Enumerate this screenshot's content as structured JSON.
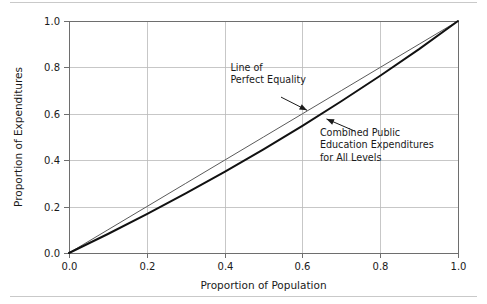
{
  "figure": {
    "background_color": "#ffffff",
    "rule_color": "#c9c9c9",
    "has_top_rule": true,
    "has_bottom_rule": true
  },
  "chart_data": {
    "type": "line",
    "title": "",
    "subtitle": "",
    "xlabel": "Proportion of Population",
    "ylabel": "Proportion of Expenditures",
    "xlim": [
      0.0,
      1.0
    ],
    "ylim": [
      0.0,
      1.0
    ],
    "xticks": [
      "0.0",
      "0.2",
      "0.4",
      "0.6",
      "0.8",
      "1.0"
    ],
    "yticks": [
      "0.0",
      "0.2",
      "0.4",
      "0.6",
      "0.8",
      "1.0"
    ],
    "xtick_values": [
      0.0,
      0.2,
      0.4,
      0.6,
      0.8,
      1.0
    ],
    "ytick_values": [
      0.0,
      0.2,
      0.4,
      0.6,
      0.8,
      1.0
    ],
    "grid": true,
    "grid_color": "#b9b9b9",
    "legend_position": "none",
    "x": [
      0.0,
      0.1,
      0.2,
      0.3,
      0.4,
      0.5,
      0.6,
      0.7,
      0.8,
      0.9,
      1.0
    ],
    "series": [
      {
        "name": "Line of Perfect Equality",
        "color": "#5a5a5a",
        "line_width": 1,
        "values": [
          0.0,
          0.1,
          0.2,
          0.3,
          0.4,
          0.5,
          0.6,
          0.7,
          0.8,
          0.9,
          1.0
        ]
      },
      {
        "name": "Combined Public Education Expenditures for All Levels",
        "color": "#111111",
        "line_width": 2,
        "values": [
          0.0,
          0.082,
          0.168,
          0.257,
          0.35,
          0.447,
          0.548,
          0.654,
          0.764,
          0.879,
          1.0
        ]
      }
    ],
    "annotations": [
      {
        "id": "equality-annotation",
        "lines": [
          "Line of",
          "Perfect Equality"
        ],
        "text_x": 0.415,
        "text_y": 0.785,
        "arrow_from": [
          0.545,
          0.672
        ],
        "arrow_to": [
          0.612,
          0.615
        ]
      },
      {
        "id": "lorenz-annotation",
        "lines": [
          "Combined Public",
          "Education Expenditures",
          "for All Levels"
        ],
        "text_x": 0.645,
        "text_y": 0.505,
        "arrow_from": [
          0.735,
          0.525
        ],
        "arrow_to": [
          0.662,
          0.578
        ]
      }
    ]
  }
}
